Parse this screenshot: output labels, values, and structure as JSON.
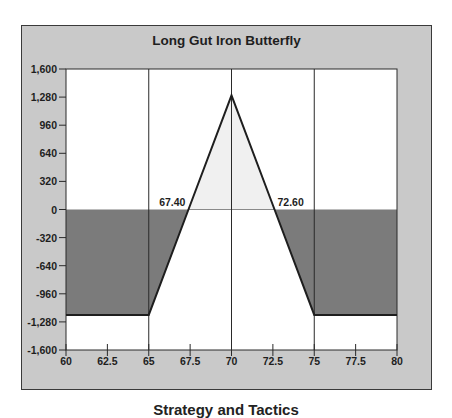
{
  "chart_data": {
    "type": "line",
    "title": "Long Gut Iron Butterfly",
    "xlabel": "",
    "ylabel": "",
    "x_ticks": [
      "60",
      "62.5",
      "65",
      "67.5",
      "70",
      "72.5",
      "75",
      "77.5",
      "80"
    ],
    "y_ticks": [
      "1,600",
      "1,280",
      "960",
      "640",
      "320",
      "0",
      "-320",
      "-640",
      "-960",
      "-1,280",
      "-1,600"
    ],
    "xlim": [
      60,
      80
    ],
    "ylim": [
      -1600,
      1600
    ],
    "grid": "vertical lines at 65, 70, 75",
    "series": [
      {
        "name": "Profit/Loss at expiration",
        "x": [
          60,
          65,
          67.4,
          70,
          72.6,
          75,
          80
        ],
        "y": [
          -1200,
          -1200,
          0,
          1300,
          0,
          -1200,
          -1200
        ]
      }
    ],
    "annotations": [
      {
        "text": "67.40",
        "x": 67.4,
        "y": 0,
        "role": "lower breakeven"
      },
      {
        "text": "72.60",
        "x": 72.6,
        "y": 0,
        "role": "upper breakeven"
      }
    ],
    "shading": {
      "profit_region": "#f0f0f0",
      "loss_region": "#7b7b7b"
    }
  },
  "colors": {
    "panel_bg": "#c9c9c9",
    "plot_bg": "#ffffff",
    "loss_fill": "#7b7b7b",
    "profit_fill": "#f0f0f0",
    "line": "#1e1e1e"
  },
  "caption": "Strategy and Tactics"
}
